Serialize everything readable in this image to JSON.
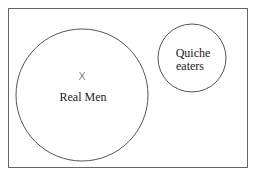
{
  "diagram": {
    "type": "euler-diagram",
    "universe": {
      "label": ""
    },
    "sets": [
      {
        "id": "real-men",
        "label": "Real Men",
        "element_marker": "X"
      },
      {
        "id": "quiche-eaters",
        "label_lines": [
          "Quiche",
          "eaters"
        ]
      }
    ],
    "relationship": "disjoint",
    "colors": {
      "stroke": "#555555",
      "text": "#222222",
      "background": "#ffffff"
    }
  }
}
